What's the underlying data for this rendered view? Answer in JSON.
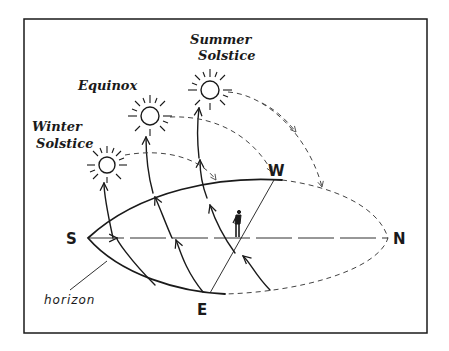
{
  "diagram": {
    "labels": {
      "summer": [
        "Summer",
        "Solstice"
      ],
      "equinox": "Equinox",
      "winter": [
        "Winter",
        "Solstice"
      ],
      "horizon": "horizon"
    },
    "directions": {
      "south": "S",
      "north": "N",
      "west": "W",
      "east": "E"
    },
    "icons": [
      "sun-icon",
      "sun-icon",
      "sun-icon",
      "observer-person-icon"
    ],
    "colors": {
      "ink": "#1a1a1a",
      "paper": "#ffffff"
    }
  }
}
